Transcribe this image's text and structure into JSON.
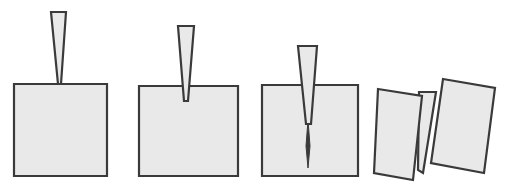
{
  "figure": {
    "background_color": "#ffffff",
    "width": 509,
    "height": 194
  },
  "style": {
    "fill_color": "#e9e9e9",
    "stroke_color": "#3a3a3a",
    "crack_color": "#3a3a3a",
    "stroke_width": 2.2,
    "wedge_stroke_width": 2.2
  },
  "panels": [
    {
      "id": "panel-1",
      "stage_label": "contact",
      "stage_number": 1,
      "description": "Wedge tip just touching the top surface of the intact block",
      "block": {
        "name": "intact-block",
        "points": "14,84 107,84 107,176 14,176",
        "rotation_deg": 0
      },
      "wedge": {
        "name": "wedge",
        "points": "51,12 66,12 61,84 58,84",
        "penetration_px": 0
      },
      "crack": {
        "name": "crack",
        "path": "",
        "depth_px": 0,
        "visible": false
      }
    },
    {
      "id": "panel-2",
      "stage_label": "initial-penetration",
      "stage_number": 2,
      "description": "Wedge has penetrated a short distance; a small notch has opened",
      "block": {
        "name": "intact-block",
        "points": "139,86 238,86 238,176 139,176",
        "rotation_deg": 0
      },
      "wedge": {
        "name": "wedge",
        "points": "178,26 194,26 188,101 184,101",
        "penetration_px": 15
      },
      "crack": {
        "name": "crack",
        "path": "M 186 86 L 188 101 L 184 101 Z",
        "depth_px": 15,
        "visible": true
      }
    },
    {
      "id": "panel-3",
      "stage_label": "crack-propagation",
      "stage_number": 3,
      "description": "Wedge driven deeper; a thin crack runs ahead of the tip toward the base",
      "block": {
        "name": "intact-block",
        "points": "262,85 358,85 358,176 262,176",
        "rotation_deg": 0
      },
      "wedge": {
        "name": "wedge",
        "points": "298,46 317,46 311,124 306,124",
        "penetration_px": 39
      },
      "crack": {
        "name": "crack",
        "path": "M 308 120 L 310 146 L 308 168 L 306 146 Z",
        "depth_px": 83,
        "visible": true
      }
    },
    {
      "id": "panel-4",
      "stage_label": "fracture-separation",
      "stage_number": 4,
      "description": "Block has split into two halves that rotate away from the wedge",
      "block": {
        "name": "left-fragment",
        "points": "378,89 422,96 413,180 374,173",
        "rotation_deg": -6
      },
      "block_right": {
        "name": "right-fragment",
        "points": "443,79 495,88 484,173 431,163",
        "rotation_deg": 8
      },
      "wedge": {
        "name": "wedge",
        "points": "419,92 436,92 423,173 418,170",
        "penetration_px": 80
      },
      "crack": {
        "name": "crack",
        "path": "",
        "depth_px": 0,
        "visible": false
      }
    }
  ]
}
